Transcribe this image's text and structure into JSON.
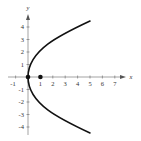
{
  "diagram": {
    "type": "parabola-graph",
    "equation_shape": "x = y^2 / 4",
    "axes": {
      "x_label": "x",
      "y_label": "y",
      "x_ticks": [
        "-1",
        "1",
        "2",
        "3",
        "4",
        "5",
        "6",
        "7"
      ],
      "y_ticks": [
        "4",
        "3",
        "2",
        "1",
        "-1",
        "-2",
        "-3",
        "-4"
      ]
    },
    "points": [
      {
        "name": "vertex",
        "x": 0,
        "y": 0
      },
      {
        "name": "focus",
        "x": 1,
        "y": 0
      }
    ],
    "colors": {
      "curve": "#111111",
      "axis": "#555555",
      "background": "#ffffff"
    }
  }
}
